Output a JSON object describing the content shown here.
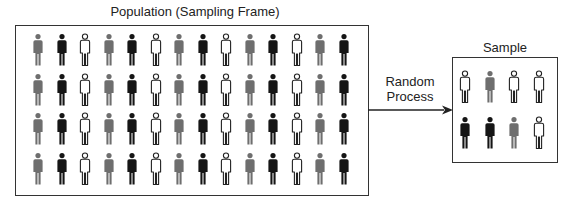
{
  "population": {
    "title": "Population (Sampling Frame)",
    "rows": [
      [
        "gray",
        "black",
        "white",
        "gray",
        "black",
        "white",
        "gray",
        "black",
        "white",
        "gray",
        "black",
        "white",
        "gray",
        "black"
      ],
      [
        "gray",
        "black",
        "white",
        "gray",
        "black",
        "white",
        "gray",
        "black",
        "white",
        "gray",
        "black",
        "white",
        "gray",
        "black"
      ],
      [
        "gray",
        "black",
        "white",
        "gray",
        "black",
        "white",
        "gray",
        "black",
        "white",
        "gray",
        "black",
        "white",
        "gray",
        "black"
      ],
      [
        "gray",
        "black",
        "white",
        "gray",
        "black",
        "white",
        "gray",
        "black",
        "white",
        "gray",
        "black",
        "white",
        "gray",
        "black"
      ]
    ]
  },
  "process": {
    "line1": "Random",
    "line2": "Process"
  },
  "sample": {
    "title": "Sample",
    "rows": [
      [
        "white",
        "gray",
        "white",
        "white"
      ],
      [
        "black",
        "black",
        "gray",
        "white"
      ]
    ]
  },
  "colors": {
    "gray": "#6e6e6e",
    "black": "#151515",
    "white": "#ffffff",
    "outline": "#222222"
  }
}
